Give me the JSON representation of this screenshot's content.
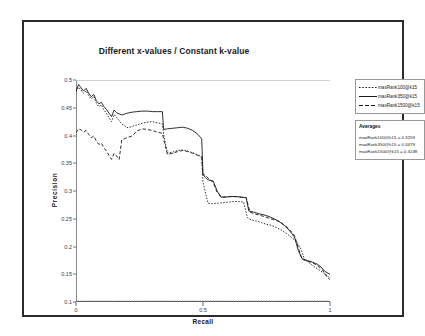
{
  "figure": {
    "title": "Different x-values / Constant k-value"
  },
  "axes": {
    "xlabel": "Recall",
    "ylabel": "Precision",
    "xticks": [
      "0",
      "0.5",
      "1"
    ],
    "yticks": [
      "0.5",
      "0.45",
      "0.4",
      "0.35",
      "0.3",
      "0.25",
      "0.2",
      "0.15",
      "0.1"
    ]
  },
  "legend": {
    "items": [
      {
        "label": "maxRank100@k15",
        "style": "dotted",
        "color": "#1a1a1a"
      },
      {
        "label": "maxRank350@k15",
        "style": "solid",
        "color": "#1a1a1a"
      },
      {
        "label": "maxRank1500@k15",
        "style": "dashed",
        "color": "#1a1a1a"
      }
    ]
  },
  "averages": {
    "title": "Averages",
    "rows": [
      "maxRank100@k15 = 0.3259",
      "maxRank350@k15 = 0.3479",
      "maxRank1500@k15 = 0.3248"
    ]
  },
  "chart_data": {
    "type": "line",
    "title": "Different x-values / Constant k-value",
    "xlabel": "Recall",
    "ylabel": "Precision",
    "xlim": [
      0,
      1
    ],
    "ylim": [
      0.1,
      0.5
    ],
    "xticks": [
      0,
      0.5,
      1
    ],
    "yticks": [
      0.1,
      0.15,
      0.2,
      0.25,
      0.3,
      0.35,
      0.4,
      0.45,
      0.5
    ],
    "grid": false,
    "legend_position": "right",
    "series": [
      {
        "name": "maxRank100@k15",
        "style": "dotted",
        "average": 0.3259,
        "x": [
          0.0,
          0.01,
          0.02,
          0.03,
          0.04,
          0.05,
          0.06,
          0.07,
          0.08,
          0.09,
          0.1,
          0.11,
          0.12,
          0.13,
          0.14,
          0.15,
          0.16,
          0.17,
          0.18,
          0.19,
          0.2,
          0.22,
          0.24,
          0.26,
          0.28,
          0.3,
          0.32,
          0.34,
          0.345,
          0.36,
          0.38,
          0.4,
          0.42,
          0.44,
          0.46,
          0.48,
          0.495,
          0.5,
          0.52,
          0.54,
          0.56,
          0.58,
          0.6,
          0.62,
          0.64,
          0.66,
          0.675,
          0.69,
          0.71,
          0.73,
          0.75,
          0.77,
          0.79,
          0.81,
          0.83,
          0.85,
          0.87,
          0.885,
          0.9,
          0.92,
          0.94,
          0.96,
          0.975,
          0.99,
          1.0
        ],
        "y": [
          0.479,
          0.487,
          0.482,
          0.476,
          0.481,
          0.472,
          0.466,
          0.47,
          0.458,
          0.452,
          0.455,
          0.446,
          0.44,
          0.432,
          0.425,
          0.438,
          0.432,
          0.427,
          0.421,
          0.418,
          0.414,
          0.416,
          0.419,
          0.422,
          0.424,
          0.425,
          0.423,
          0.421,
          0.402,
          0.368,
          0.37,
          0.373,
          0.374,
          0.372,
          0.369,
          0.365,
          0.362,
          0.315,
          0.278,
          0.277,
          0.278,
          0.279,
          0.28,
          0.281,
          0.281,
          0.28,
          0.252,
          0.248,
          0.246,
          0.243,
          0.24,
          0.238,
          0.234,
          0.229,
          0.223,
          0.216,
          0.208,
          0.196,
          0.176,
          0.17,
          0.163,
          0.157,
          0.152,
          0.147,
          0.143
        ]
      },
      {
        "name": "maxRank350@k15",
        "style": "solid",
        "average": 0.3479,
        "x": [
          0.0,
          0.01,
          0.02,
          0.03,
          0.04,
          0.05,
          0.06,
          0.07,
          0.08,
          0.09,
          0.1,
          0.11,
          0.12,
          0.13,
          0.14,
          0.15,
          0.16,
          0.18,
          0.2,
          0.22,
          0.24,
          0.26,
          0.28,
          0.3,
          0.32,
          0.34,
          0.345,
          0.36,
          0.38,
          0.4,
          0.42,
          0.44,
          0.46,
          0.48,
          0.495,
          0.5,
          0.51,
          0.52,
          0.54,
          0.555,
          0.57,
          0.59,
          0.61,
          0.63,
          0.65,
          0.67,
          0.68,
          0.7,
          0.72,
          0.74,
          0.76,
          0.78,
          0.8,
          0.82,
          0.84,
          0.86,
          0.875,
          0.89,
          0.91,
          0.93,
          0.95,
          0.965,
          0.98,
          1.0
        ],
        "y": [
          0.48,
          0.492,
          0.486,
          0.48,
          0.485,
          0.476,
          0.47,
          0.474,
          0.463,
          0.457,
          0.46,
          0.452,
          0.447,
          0.44,
          0.434,
          0.446,
          0.441,
          0.437,
          0.44,
          0.442,
          0.443,
          0.444,
          0.444,
          0.443,
          0.443,
          0.443,
          0.411,
          0.412,
          0.413,
          0.414,
          0.415,
          0.413,
          0.409,
          0.402,
          0.394,
          0.33,
          0.324,
          0.32,
          0.318,
          0.301,
          0.289,
          0.289,
          0.29,
          0.29,
          0.289,
          0.288,
          0.264,
          0.262,
          0.259,
          0.257,
          0.254,
          0.25,
          0.245,
          0.238,
          0.229,
          0.217,
          0.193,
          0.178,
          0.175,
          0.172,
          0.168,
          0.163,
          0.155,
          0.15
        ]
      },
      {
        "name": "maxRank1500@k15",
        "style": "dashed",
        "average": 0.3248,
        "x": [
          0.0,
          0.01,
          0.02,
          0.03,
          0.04,
          0.05,
          0.06,
          0.07,
          0.08,
          0.09,
          0.1,
          0.11,
          0.12,
          0.13,
          0.14,
          0.15,
          0.16,
          0.17,
          0.18,
          0.2,
          0.22,
          0.24,
          0.26,
          0.28,
          0.3,
          0.32,
          0.34,
          0.345,
          0.36,
          0.38,
          0.4,
          0.42,
          0.44,
          0.46,
          0.48,
          0.495,
          0.5,
          0.51,
          0.525,
          0.54,
          0.555,
          0.575,
          0.6,
          0.625,
          0.65,
          0.67,
          0.685,
          0.7,
          0.72,
          0.74,
          0.76,
          0.78,
          0.8,
          0.82,
          0.84,
          0.86,
          0.875,
          0.89,
          0.91,
          0.93,
          0.95,
          0.97,
          0.985,
          1.0
        ],
        "y": [
          0.405,
          0.412,
          0.41,
          0.406,
          0.409,
          0.402,
          0.396,
          0.399,
          0.39,
          0.384,
          0.386,
          0.378,
          0.372,
          0.364,
          0.357,
          0.368,
          0.363,
          0.357,
          0.392,
          0.396,
          0.399,
          0.408,
          0.412,
          0.411,
          0.409,
          0.406,
          0.404,
          0.394,
          0.366,
          0.368,
          0.371,
          0.373,
          0.371,
          0.368,
          0.364,
          0.36,
          0.33,
          0.328,
          0.321,
          0.316,
          0.298,
          0.289,
          0.29,
          0.29,
          0.289,
          0.288,
          0.262,
          0.259,
          0.257,
          0.254,
          0.251,
          0.248,
          0.245,
          0.239,
          0.231,
          0.22,
          0.198,
          0.177,
          0.174,
          0.171,
          0.166,
          0.158,
          0.147,
          0.14
        ]
      }
    ]
  }
}
